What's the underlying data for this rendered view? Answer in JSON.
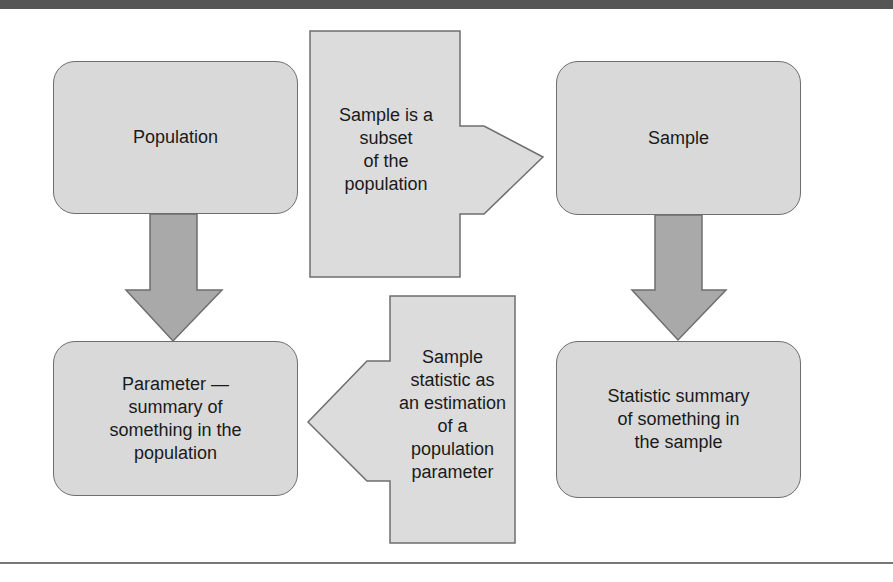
{
  "diagram": {
    "nodes": {
      "population": "Population",
      "sample": "Sample",
      "parameter": "Parameter —\nsummary of\nsomething in the\npopulation",
      "statistic": "Statistic summary\nof something in\nthe sample"
    },
    "arrows": {
      "subset": "Sample is a\nsubset\nof the\npopulation",
      "estimation": "Sample\nstatistic as\nan estimation\nof a\npopulation\nparameter"
    },
    "colors": {
      "box_fill": "#d9d9d9",
      "arrow_fill": "#a9a9a9",
      "callout_fill": "#dcdcdc",
      "stroke": "#6e6e6e",
      "top_rule": "#555555"
    }
  }
}
